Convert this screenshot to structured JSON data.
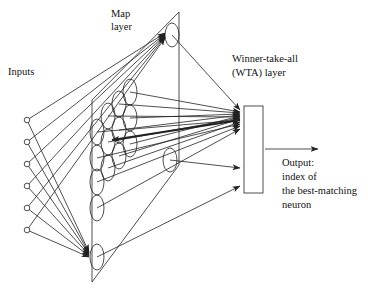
{
  "labels": {
    "inputs": "Inputs",
    "map_line1": "Map",
    "map_line2": "layer",
    "wta_line1": "Winner-take-all",
    "wta_line2": "(WTA) layer",
    "out_line1": "Output:",
    "out_line2": "index of",
    "out_line3": "the best-matching",
    "out_line4": "neuron"
  },
  "diagram": {
    "input_nodes": 6,
    "colors": {
      "stroke": "#222222",
      "background": "#ffffff"
    }
  }
}
